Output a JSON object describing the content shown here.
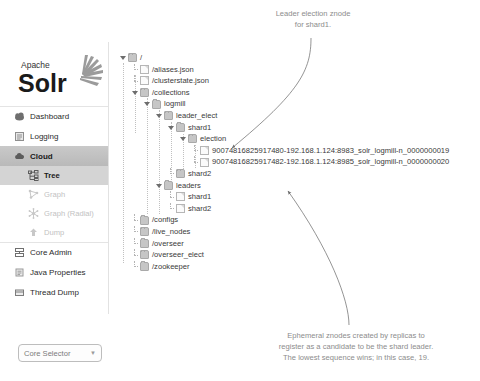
{
  "app": {
    "brand_top": "Apache",
    "brand_main": "Solr"
  },
  "sidebar": {
    "items": [
      {
        "label": "Dashboard",
        "icon": "dashboard-icon",
        "state": "normal"
      },
      {
        "label": "Logging",
        "icon": "logging-icon",
        "state": "normal"
      },
      {
        "label": "Cloud",
        "icon": "cloud-icon",
        "state": "active"
      },
      {
        "label": "Tree",
        "icon": "tree-icon",
        "state": "sub-active"
      },
      {
        "label": "Graph",
        "icon": "graph-icon",
        "state": "sub-disabled"
      },
      {
        "label": "Graph (Radial)",
        "icon": "graph-radial-icon",
        "state": "sub-disabled"
      },
      {
        "label": "Dump",
        "icon": "dump-icon",
        "state": "sub-disabled"
      },
      {
        "label": "Core Admin",
        "icon": "core-admin-icon",
        "state": "normal"
      },
      {
        "label": "Java Properties",
        "icon": "java-properties-icon",
        "state": "normal"
      },
      {
        "label": "Thread Dump",
        "icon": "thread-dump-icon",
        "state": "normal"
      }
    ],
    "core_selector": {
      "label": "Core Selector",
      "arrow": "▼"
    }
  },
  "tree": {
    "nodes": [
      {
        "label": "/",
        "type": "folder",
        "twist": "open",
        "depth": 0
      },
      {
        "label": "/aliases.json",
        "type": "file",
        "twist": "leaf",
        "depth": 1
      },
      {
        "label": "/clusterstate.json",
        "type": "file",
        "twist": "leaf",
        "depth": 1
      },
      {
        "label": "/collections",
        "type": "folder",
        "twist": "open",
        "depth": 1
      },
      {
        "label": "logmill",
        "type": "folder",
        "twist": "open",
        "depth": 2
      },
      {
        "label": "leader_elect",
        "type": "folder",
        "twist": "open",
        "depth": 3
      },
      {
        "label": "shard1",
        "type": "folder",
        "twist": "open",
        "depth": 4
      },
      {
        "label": "election",
        "type": "folder",
        "twist": "open",
        "depth": 5
      },
      {
        "label": "90074816825917480-192.168.1.124:8983_solr_logmill-n_0000000019",
        "type": "file",
        "twist": "leaf",
        "depth": 6
      },
      {
        "label": "90074816825917482-192.168.1.124:8985_solr_logmill-n_0000000020",
        "type": "file",
        "twist": "leaf",
        "depth": 6
      },
      {
        "label": "shard2",
        "type": "folder",
        "twist": "leaf",
        "depth": 4
      },
      {
        "label": "leaders",
        "type": "folder",
        "twist": "open",
        "depth": 3
      },
      {
        "label": "shard1",
        "type": "file",
        "twist": "leaf",
        "depth": 4
      },
      {
        "label": "shard2",
        "type": "file",
        "twist": "leaf",
        "depth": 4
      },
      {
        "label": "/configs",
        "type": "folder",
        "twist": "leaf",
        "depth": 1
      },
      {
        "label": "/live_nodes",
        "type": "folder",
        "twist": "leaf",
        "depth": 1
      },
      {
        "label": "/overseer",
        "type": "folder",
        "twist": "leaf",
        "depth": 1
      },
      {
        "label": "/overseer_elect",
        "type": "folder",
        "twist": "leaf",
        "depth": 1
      },
      {
        "label": "/zookeeper",
        "type": "folder",
        "twist": "leaf",
        "depth": 1
      }
    ]
  },
  "annotations": {
    "top": {
      "line1": "Leader election znode",
      "line2": "for shard1."
    },
    "bottom": {
      "line1": "Ephemeral znodes created by replicas to",
      "line2": "register as a candidate to be the shard leader.",
      "line3": "The lowest sequence wins; in this case, 19."
    }
  },
  "colors": {
    "annotation": "#8c8c8c",
    "active_nav": "#c9c9c9",
    "folder": "#c6c6c6",
    "text": "#3a3a3a"
  }
}
